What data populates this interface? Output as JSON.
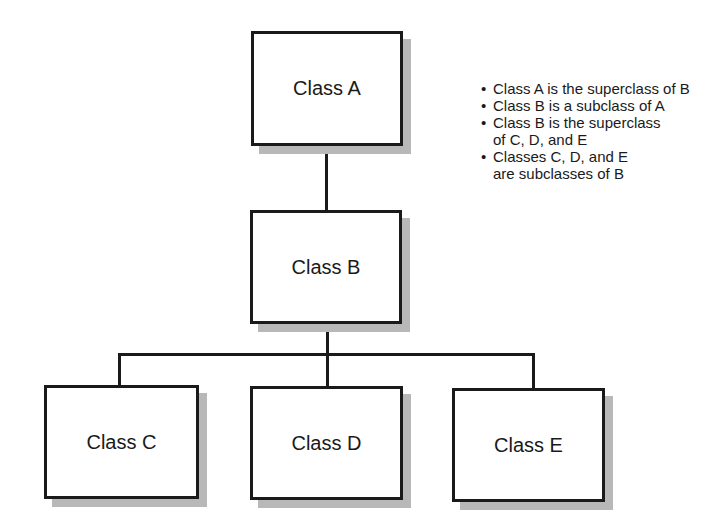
{
  "diagram": {
    "type": "class-hierarchy",
    "nodes": [
      {
        "id": "A",
        "label": "Class A"
      },
      {
        "id": "B",
        "label": "Class B"
      },
      {
        "id": "C",
        "label": "Class C"
      },
      {
        "id": "D",
        "label": "Class D"
      },
      {
        "id": "E",
        "label": "Class E"
      }
    ],
    "edges": [
      {
        "from": "A",
        "to": "B"
      },
      {
        "from": "B",
        "to": "C"
      },
      {
        "from": "B",
        "to": "D"
      },
      {
        "from": "B",
        "to": "E"
      }
    ],
    "notes": [
      "Class A is the superclass of B",
      "Class B is a subclass of A",
      "Class B is the superclass\nof C, D, and E",
      "Classes C, D, and E\nare subclasses of B"
    ]
  },
  "colors": {
    "stroke": "#1a1a1a",
    "shadow": "#b8b8b8",
    "fill": "#ffffff"
  }
}
